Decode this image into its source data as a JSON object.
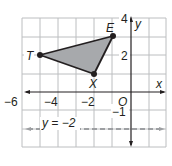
{
  "figure": {
    "type": "coordinate-plane",
    "x_axis_label": "x",
    "y_axis_label": "y",
    "origin_label": "O",
    "x_range": [
      -6,
      2
    ],
    "y_range": [
      -3,
      4
    ],
    "x_tick_labels": [
      "−6",
      "−4",
      "−2"
    ],
    "y_tick_labels": [
      "4",
      "2",
      "−1"
    ],
    "triangle": {
      "fill": "#a7a9ac",
      "stroke": "#231f20",
      "vertices": [
        {
          "label": "T",
          "x": -5,
          "y": 2
        },
        {
          "label": "E",
          "x": -1,
          "y": 3
        },
        {
          "label": "X",
          "x": -2,
          "y": 1
        }
      ]
    },
    "line": {
      "label": "y = −2",
      "equation_y": -2,
      "style": "dashed",
      "color": "#9d9fa2"
    },
    "colors": {
      "grid": "#bcbec0",
      "axis": "#231f20"
    }
  }
}
